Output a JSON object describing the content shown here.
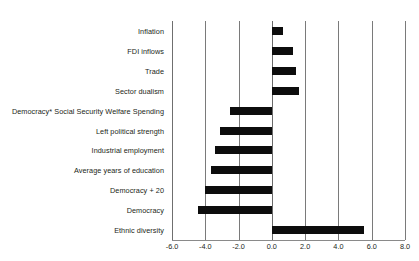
{
  "chart_data": {
    "type": "bar",
    "orientation": "horizontal",
    "title": "",
    "subtitle": "",
    "xlabel": "",
    "ylabel": "",
    "xlim": [
      -6.0,
      8.0
    ],
    "xticks": [
      -6.0,
      -4.0,
      -2.0,
      0.0,
      2.0,
      4.0,
      6.0,
      8.0
    ],
    "xtick_labels": [
      "-6.0",
      "-4.0",
      "-2.0",
      "0.0",
      "2.0",
      "4.0",
      "6.0",
      "8.0"
    ],
    "grid": true,
    "grid_axis": "x",
    "legend": null,
    "bar_color": "#0d0d0d",
    "categories": [
      "Inflation",
      "FDI inflows",
      "Trade",
      "Sector dualism",
      "Democracy* Social Security Welfare Spending",
      "Left political strength",
      "Industrial employment",
      "Average years of education",
      "Democracy + 20",
      "Democracy",
      "Ethnic diversity"
    ],
    "values": [
      0.65,
      1.3,
      1.45,
      1.65,
      -2.5,
      -3.1,
      -3.4,
      -3.65,
      -4.0,
      -4.45,
      5.55
    ]
  }
}
